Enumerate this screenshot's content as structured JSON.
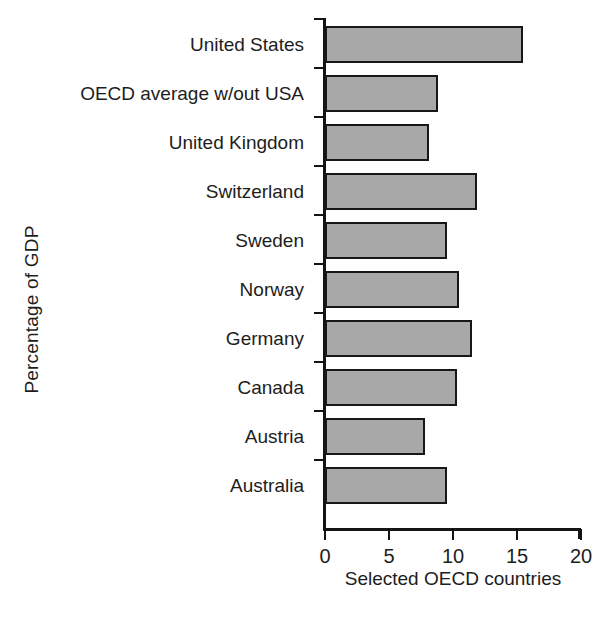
{
  "chart_data": {
    "type": "bar",
    "orientation": "horizontal",
    "title": "",
    "xlabel": "Selected OECD countries",
    "ylabel": "Percentage of GDP",
    "xlim": [
      0,
      20
    ],
    "xticks": [
      0,
      5,
      10,
      15,
      20
    ],
    "xticklabels": [
      "0",
      "5",
      "10",
      "15",
      "20"
    ],
    "grid": false,
    "legend": null,
    "categories": [
      "United States",
      "OECD average w/out USA",
      "United Kingdom",
      "Switzerland",
      "Sweden",
      "Norway",
      "Germany",
      "Canada",
      "Austria",
      "Australia"
    ],
    "values": [
      15.5,
      8.8,
      8.1,
      11.9,
      9.5,
      10.5,
      11.5,
      10.3,
      7.8,
      9.5
    ],
    "bar_fill_color": "#a8a8a8",
    "bar_edge_color": "#171717",
    "axis_color": "#141414",
    "background_color": "#ffffff"
  }
}
